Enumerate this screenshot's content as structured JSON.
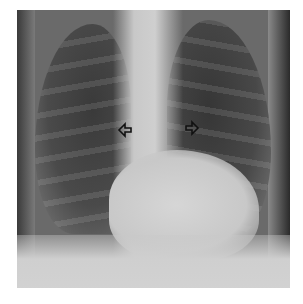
{
  "image": {
    "subject": "chest radiograph, frontal view",
    "annotations": [
      {
        "type": "arrow",
        "direction": "left",
        "x": 124,
        "y": 130
      },
      {
        "type": "arrow",
        "direction": "right",
        "x": 192,
        "y": 130
      }
    ],
    "colors": {
      "background": "#ffffff",
      "lung_dark": "#3a3a3a",
      "soft_tissue": "#cfcfcf",
      "arrow": "#111111"
    }
  }
}
